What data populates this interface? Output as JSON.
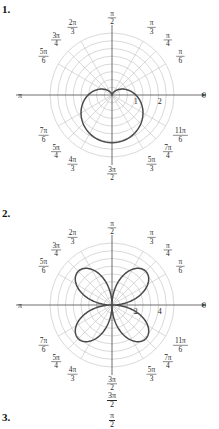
{
  "document": {
    "top_bleed_text": "",
    "problems": [
      {
        "id": "1",
        "label": "1."
      },
      {
        "id": "2",
        "label": "2."
      },
      {
        "id": "3",
        "label": "3."
      }
    ]
  },
  "stray_labels": {
    "three_pi_over_two": {
      "num": "3π",
      "den": "2"
    },
    "pi_over_two": {
      "num": "π",
      "den": "2"
    }
  },
  "colors": {
    "curve": "#4a4a4a",
    "axis": "#555555",
    "grid": "#b9b9b9",
    "spoke": "#bdbdbd",
    "text": "#2a2a2a",
    "background": "#ffffff"
  },
  "chart_data": [
    {
      "type": "line",
      "plot_kind": "polar",
      "title": "1.",
      "curve_name": "cardioid",
      "equation": "r = 1 - sin(theta)",
      "grid": true,
      "legend": "none",
      "rmax": 2.6,
      "radial_ticks": [
        1,
        2
      ],
      "radial_tick_labels": [
        "1",
        "2"
      ],
      "angle_tick_count": 12,
      "grid_circle_count": 8,
      "angle_labels": [
        {
          "angle_deg": 0,
          "num": "0",
          "den": "",
          "plain": "0"
        },
        {
          "angle_deg": 30,
          "num": "π",
          "den": "6",
          "plain": "π/6"
        },
        {
          "angle_deg": 45,
          "num": "π",
          "den": "4",
          "plain": "π/4"
        },
        {
          "angle_deg": 60,
          "num": "π",
          "den": "3",
          "plain": "π/3"
        },
        {
          "angle_deg": 90,
          "num": "π",
          "den": "2",
          "plain": "π/2"
        },
        {
          "angle_deg": 120,
          "num": "2π",
          "den": "3",
          "plain": "2π/3"
        },
        {
          "angle_deg": 135,
          "num": "3π",
          "den": "4",
          "plain": "3π/4"
        },
        {
          "angle_deg": 150,
          "num": "5π",
          "den": "6",
          "plain": "5π/6"
        },
        {
          "angle_deg": 180,
          "num": "π",
          "den": "",
          "plain": "π"
        },
        {
          "angle_deg": 210,
          "num": "7π",
          "den": "6",
          "plain": "7π/6"
        },
        {
          "angle_deg": 225,
          "num": "5π",
          "den": "4",
          "plain": "5π/4"
        },
        {
          "angle_deg": 240,
          "num": "4π",
          "den": "3",
          "plain": "4π/3"
        },
        {
          "angle_deg": 270,
          "num": "3π",
          "den": "2",
          "plain": "3π/2"
        },
        {
          "angle_deg": 300,
          "num": "5π",
          "den": "3",
          "plain": "5π/3"
        },
        {
          "angle_deg": 315,
          "num": "7π",
          "den": "4",
          "plain": "7π/4"
        },
        {
          "angle_deg": 330,
          "num": "11π",
          "den": "6",
          "plain": "11π/6"
        }
      ],
      "theta_deg": [
        0,
        10,
        20,
        30,
        40,
        50,
        60,
        70,
        80,
        90,
        100,
        110,
        120,
        130,
        140,
        150,
        160,
        170,
        180,
        190,
        200,
        210,
        220,
        230,
        240,
        250,
        260,
        270,
        280,
        290,
        300,
        310,
        320,
        330,
        340,
        350,
        360
      ],
      "r_values": [
        1.0,
        0.826,
        0.658,
        0.5,
        0.357,
        0.234,
        0.134,
        0.06,
        0.015,
        0.0,
        0.015,
        0.06,
        0.134,
        0.234,
        0.357,
        0.5,
        0.658,
        0.826,
        1.0,
        1.174,
        1.342,
        1.5,
        1.643,
        1.766,
        1.866,
        1.94,
        1.985,
        2.0,
        1.985,
        1.94,
        1.866,
        1.766,
        1.643,
        1.5,
        1.342,
        1.174,
        1.0
      ]
    },
    {
      "type": "line",
      "plot_kind": "polar",
      "title": "2.",
      "curve_name": "four-petaled rose",
      "equation": "r = 4 sin(2 theta)",
      "grid": true,
      "legend": "none",
      "rmax": 5.2,
      "radial_ticks": [
        2,
        4
      ],
      "radial_tick_labels": [
        "2",
        "4"
      ],
      "angle_tick_count": 12,
      "grid_circle_count": 8,
      "angle_labels": [
        {
          "angle_deg": 0,
          "num": "0",
          "den": "",
          "plain": "0"
        },
        {
          "angle_deg": 30,
          "num": "π",
          "den": "6",
          "plain": "π/6"
        },
        {
          "angle_deg": 45,
          "num": "π",
          "den": "4",
          "plain": "π/4"
        },
        {
          "angle_deg": 60,
          "num": "π",
          "den": "3",
          "plain": "π/3"
        },
        {
          "angle_deg": 90,
          "num": "π",
          "den": "2",
          "plain": "π/2"
        },
        {
          "angle_deg": 120,
          "num": "2π",
          "den": "3",
          "plain": "2π/3"
        },
        {
          "angle_deg": 135,
          "num": "3π",
          "den": "4",
          "plain": "3π/4"
        },
        {
          "angle_deg": 150,
          "num": "5π",
          "den": "6",
          "plain": "5π/6"
        },
        {
          "angle_deg": 180,
          "num": "π",
          "den": "",
          "plain": "π"
        },
        {
          "angle_deg": 210,
          "num": "7π",
          "den": "6",
          "plain": "7π/6"
        },
        {
          "angle_deg": 225,
          "num": "5π",
          "den": "4",
          "plain": "5π/4"
        },
        {
          "angle_deg": 240,
          "num": "4π",
          "den": "3",
          "plain": "4π/3"
        },
        {
          "angle_deg": 270,
          "num": "3π",
          "den": "2",
          "plain": "3π/2"
        },
        {
          "angle_deg": 300,
          "num": "5π",
          "den": "3",
          "plain": "5π/3"
        },
        {
          "angle_deg": 315,
          "num": "7π",
          "den": "4",
          "plain": "7π/4"
        },
        {
          "angle_deg": 330,
          "num": "11π",
          "den": "6",
          "plain": "11π/6"
        }
      ],
      "petal_angles_deg": [
        45,
        135,
        225,
        315
      ],
      "petal_max_radius": 4
    }
  ]
}
